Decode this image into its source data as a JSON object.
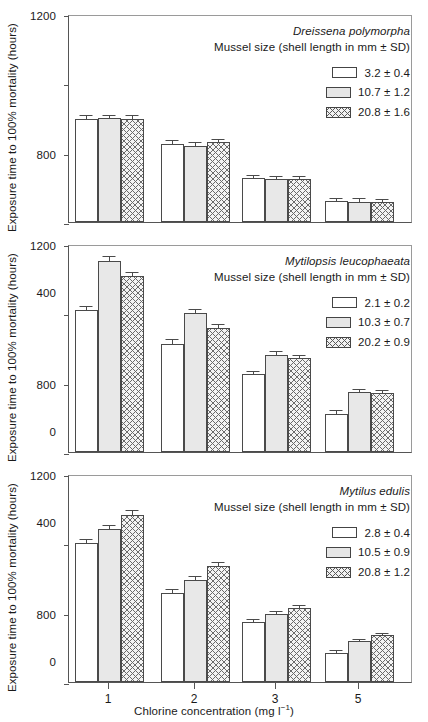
{
  "figure": {
    "xlabel_text": "Chlorine concentration (mg l",
    "xlabel_unit_sup": "−1",
    "xlabel_close": ")",
    "ylabel": "Exposure time to 100% mortality (hours)",
    "subhead": "Mussel size (shell length in mm ± SD)",
    "ytick_labels": [
      "1200",
      "800",
      "400",
      "0"
    ],
    "xtick_labels": [
      "1",
      "2",
      "3",
      "5"
    ],
    "colors": {
      "axis": "#555555",
      "bar_outline": "#4a4a4a",
      "bar_white": "#ffffff",
      "bar_gray": "#e8e8e8",
      "bar_hatch_line": "#6a6a6a",
      "text": "#1a1a1a"
    }
  },
  "chart_data": [
    {
      "type": "bar",
      "title": "Dreissena polymorpha",
      "subtitle": "Mussel size (shell length in mm ± SD)",
      "xlabel": "Chlorine concentration (mg l−1)",
      "ylabel": "Exposure time to 100% mortality (hours)",
      "categories": [
        "1",
        "2",
        "3",
        "5"
      ],
      "ylim": [
        0,
        1200
      ],
      "yticks": [
        0,
        400,
        800,
        1200
      ],
      "grid": false,
      "legend_position": "top-right",
      "series": [
        {
          "name": "3.2 ± 0.4",
          "fill": "white",
          "values": [
            595,
            450,
            255,
            120
          ],
          "errors": [
            22,
            22,
            14,
            17
          ]
        },
        {
          "name": "10.7 ± 1.2",
          "fill": "gray",
          "values": [
            600,
            440,
            250,
            118
          ],
          "errors": [
            20,
            20,
            15,
            22
          ]
        },
        {
          "name": "20.8 ± 1.6",
          "fill": "hatch",
          "values": [
            595,
            460,
            248,
            118
          ],
          "errors": [
            20,
            18,
            15,
            15
          ]
        }
      ]
    },
    {
      "type": "bar",
      "title": "Mytilopsis leucophaeata",
      "subtitle": "Mussel size (shell length in mm ± SD)",
      "xlabel": "Chlorine concentration (mg l−1)",
      "ylabel": "Exposure time to 100% mortality (hours)",
      "categories": [
        "1",
        "2",
        "3",
        "5"
      ],
      "ylim": [
        0,
        1200
      ],
      "yticks": [
        0,
        400,
        800,
        1200
      ],
      "grid": false,
      "legend_position": "top-right",
      "series": [
        {
          "name": "2.1 ± 0.2",
          "fill": "white",
          "values": [
            820,
            625,
            450,
            220
          ],
          "errors": [
            25,
            25,
            20,
            20
          ]
        },
        {
          "name": "10.3 ± 0.7",
          "fill": "gray",
          "values": [
            1100,
            800,
            560,
            345
          ],
          "errors": [
            30,
            28,
            22,
            20
          ]
        },
        {
          "name": "20.2 ± 0.9",
          "fill": "hatch",
          "values": [
            1015,
            715,
            540,
            340
          ],
          "errors": [
            25,
            22,
            20,
            18
          ]
        }
      ]
    },
    {
      "type": "bar",
      "title": "Mytilus edulis",
      "subtitle": "Mussel size (shell length in mm ± SD)",
      "xlabel": "Chlorine concentration (mg l−1)",
      "ylabel": "Exposure time to 100% mortality (hours)",
      "categories": [
        "1",
        "2",
        "3",
        "5"
      ],
      "ylim": [
        0,
        1200
      ],
      "yticks": [
        0,
        400,
        800,
        1200
      ],
      "grid": false,
      "legend_position": "top-right",
      "series": [
        {
          "name": "2.8 ± 0.4",
          "fill": "white",
          "values": [
            800,
            515,
            345,
            170
          ],
          "errors": [
            25,
            20,
            18,
            14
          ]
        },
        {
          "name": "10.5 ± 0.9",
          "fill": "gray",
          "values": [
            880,
            590,
            390,
            235
          ],
          "errors": [
            25,
            20,
            20,
            15
          ]
        },
        {
          "name": "20.8 ± 1.2",
          "fill": "hatch",
          "values": [
            965,
            670,
            425,
            270
          ],
          "errors": [
            28,
            22,
            18,
            15
          ]
        }
      ]
    }
  ]
}
